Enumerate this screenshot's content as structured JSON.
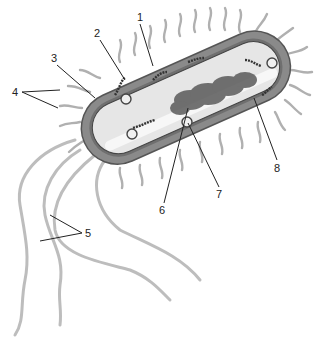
{
  "diagram": {
    "colors": {
      "background": "#ffffff",
      "outline": "#555555",
      "capsule": "#8a8a8a",
      "cytoplasm": "#e6e6e6",
      "nucleoid": "#5a5a5a",
      "flagellum": "#bdbdbd",
      "leader": "#222222"
    },
    "labels": [
      {
        "id": "1",
        "text": "1",
        "x": 139,
        "y": 14
      },
      {
        "id": "2",
        "text": "2",
        "x": 96,
        "y": 30
      },
      {
        "id": "3",
        "text": "3",
        "x": 53,
        "y": 55
      },
      {
        "id": "4",
        "text": "4",
        "x": 13,
        "y": 88
      },
      {
        "id": "5",
        "text": "5",
        "x": 84,
        "y": 230
      },
      {
        "id": "6",
        "text": "6",
        "x": 162,
        "y": 206
      },
      {
        "id": "7",
        "text": "7",
        "x": 218,
        "y": 190
      },
      {
        "id": "8",
        "text": "8",
        "x": 275,
        "y": 163
      }
    ]
  }
}
